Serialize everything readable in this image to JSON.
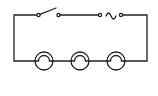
{
  "diagram": {
    "type": "series-circuit",
    "stroke_color": "#222222",
    "background": "#ffffff",
    "components": [
      {
        "kind": "switch",
        "state": "open",
        "icon": "switch-open-icon"
      },
      {
        "kind": "ac-source",
        "icon": "ac-source-icon"
      },
      {
        "kind": "lamp",
        "index": 1,
        "icon": "lamp-icon"
      },
      {
        "kind": "lamp",
        "index": 2,
        "icon": "lamp-icon"
      },
      {
        "kind": "lamp",
        "index": 3,
        "icon": "lamp-icon"
      }
    ]
  }
}
